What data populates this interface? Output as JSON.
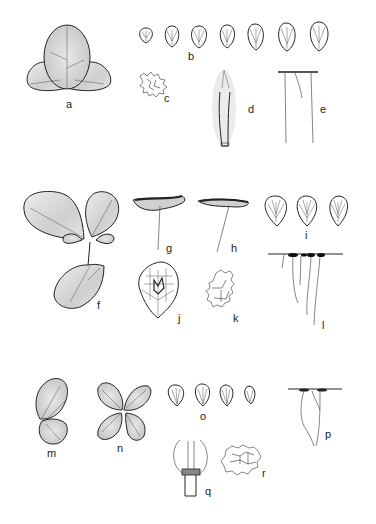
{
  "plate": {
    "background": "#ffffff",
    "ink": "#222222",
    "shade": "#bdbdbd",
    "figures": [
      {
        "id": "a",
        "label": "a",
        "subject": "trifoliate leaf, adaxial view"
      },
      {
        "id": "b",
        "label": "b",
        "subject": "series of 7 leaflets with venation",
        "count": 7
      },
      {
        "id": "c",
        "label": "c",
        "subject": "epidermal cells"
      },
      {
        "id": "d",
        "label": "d",
        "subject": "stipule / petiole base"
      },
      {
        "id": "e",
        "label": "e",
        "subject": "leaflet margin with hairs"
      },
      {
        "id": "f",
        "label": "f",
        "subject": "trifoliate leaf, large form"
      },
      {
        "id": "g",
        "label": "g",
        "subject": "leaflet section on stalk"
      },
      {
        "id": "h",
        "label": "h",
        "subject": "leaflet section on stalk"
      },
      {
        "id": "i",
        "label": "i",
        "subject": "series of 3 leaflets with venation",
        "count": 3
      },
      {
        "id": "j",
        "label": "j",
        "subject": "leaflet with vein reticulation"
      },
      {
        "id": "k",
        "label": "k",
        "subject": "epidermal cells"
      },
      {
        "id": "l",
        "label": "l",
        "subject": "leaflet margin with hairs"
      },
      {
        "id": "m",
        "label": "m",
        "subject": "leaf, side view"
      },
      {
        "id": "n",
        "label": "n",
        "subject": "four-leaflet leaf"
      },
      {
        "id": "o",
        "label": "o",
        "subject": "series of 4 leaflets",
        "count": 4
      },
      {
        "id": "p",
        "label": "p",
        "subject": "leaflet margin with hairs"
      },
      {
        "id": "q",
        "label": "q",
        "subject": "stipule and petiole base"
      },
      {
        "id": "r",
        "label": "r",
        "subject": "epidermal cells"
      }
    ]
  }
}
